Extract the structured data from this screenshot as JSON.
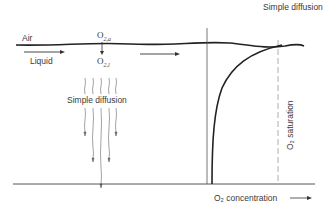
{
  "diagram": {
    "title": "Simple diffusion",
    "left_panel": {
      "air_label": "Air",
      "liquid_label": "Liquid",
      "o2_air_label": "O",
      "o2_air_sub": "2,a",
      "o2_liquid_label": "O",
      "o2_liquid_sub": "2,l",
      "diffusion_label": "Simple diffusion"
    },
    "right_panel": {
      "saturation_label": "O₂ saturation",
      "x_axis_label": "O₂ concentration",
      "x_axis_arrow": "→"
    }
  }
}
